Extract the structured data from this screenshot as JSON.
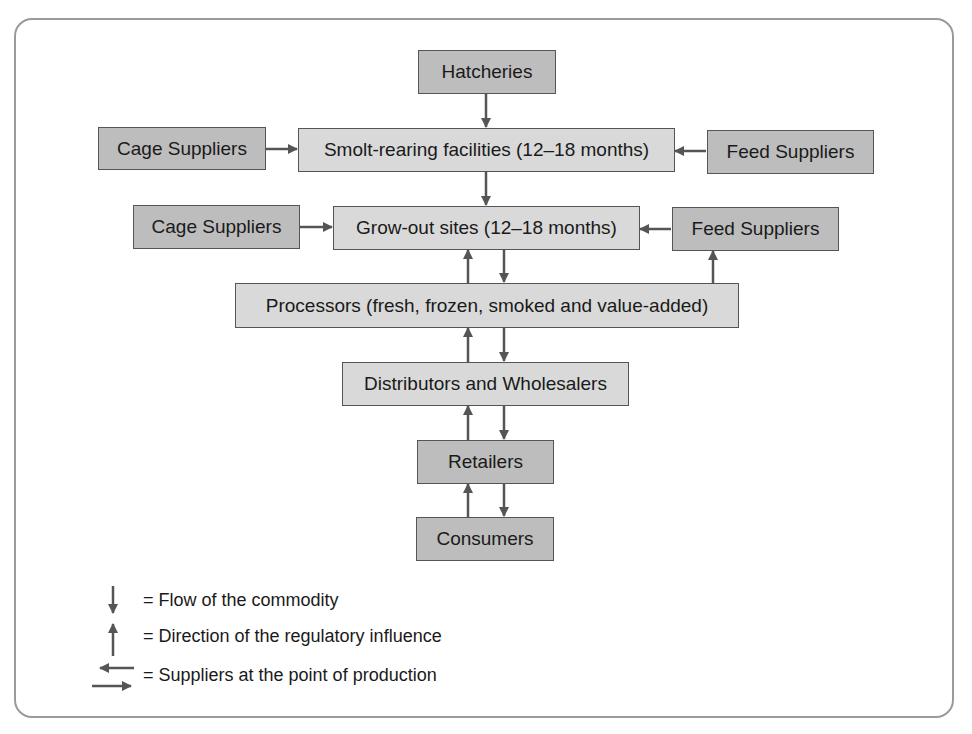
{
  "diagram": {
    "colors": {
      "dark_box": "#bdbdbd",
      "light_box": "#d9d9d9",
      "arrow": "#555555",
      "frame": "#9a9a9a"
    },
    "nodes": {
      "hatcheries": "Hatcheries",
      "smolt_rearing": "Smolt-rearing facilities (12–18 months)",
      "cage_suppliers_1": "Cage Suppliers",
      "feed_suppliers_1": "Feed Suppliers",
      "grow_out": "Grow-out sites (12–18 months)",
      "cage_suppliers_2": "Cage Suppliers",
      "feed_suppliers_2": "Feed Suppliers",
      "processors": "Processors (fresh, frozen, smoked and value-added)",
      "distributors": "Distributors and Wholesalers",
      "retailers": "Retailers",
      "consumers": "Consumers"
    },
    "edges": [
      {
        "from": "Hatcheries",
        "to": "Smolt-rearing facilities",
        "type": "commodity-flow"
      },
      {
        "from": "Cage Suppliers",
        "to": "Smolt-rearing facilities",
        "type": "supplier"
      },
      {
        "from": "Feed Suppliers",
        "to": "Smolt-rearing facilities",
        "type": "supplier"
      },
      {
        "from": "Smolt-rearing facilities",
        "to": "Grow-out sites",
        "type": "commodity-flow"
      },
      {
        "from": "Cage Suppliers",
        "to": "Grow-out sites",
        "type": "supplier"
      },
      {
        "from": "Feed Suppliers",
        "to": "Grow-out sites",
        "type": "supplier"
      },
      {
        "from": "Grow-out sites",
        "to": "Processors",
        "type": "commodity-flow"
      },
      {
        "from": "Processors",
        "to": "Grow-out sites",
        "type": "regulatory-influence"
      },
      {
        "from": "Processors",
        "to": "Feed Suppliers",
        "type": "regulatory-influence"
      },
      {
        "from": "Processors",
        "to": "Distributors and Wholesalers",
        "type": "commodity-flow"
      },
      {
        "from": "Distributors and Wholesalers",
        "to": "Processors",
        "type": "regulatory-influence"
      },
      {
        "from": "Distributors and Wholesalers",
        "to": "Retailers",
        "type": "commodity-flow"
      },
      {
        "from": "Retailers",
        "to": "Distributors and Wholesalers",
        "type": "regulatory-influence"
      },
      {
        "from": "Retailers",
        "to": "Consumers",
        "type": "commodity-flow"
      },
      {
        "from": "Consumers",
        "to": "Retailers",
        "type": "regulatory-influence"
      }
    ]
  },
  "legend": {
    "items": [
      {
        "icon": "down-arrow-icon",
        "label": "= Flow of the commodity"
      },
      {
        "icon": "up-arrow-icon",
        "label": "= Direction of the regulatory influence"
      },
      {
        "icon": "left-right-arrows-icon",
        "label": "= Suppliers at the point of production"
      }
    ]
  }
}
